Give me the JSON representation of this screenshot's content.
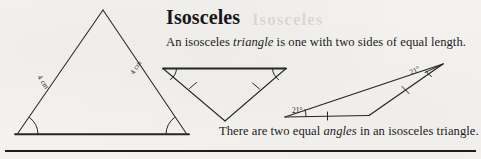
{
  "page": {
    "background_color": "#f4f2ee",
    "ink_color": "#1d1d20"
  },
  "heading": {
    "text": "Isosceles"
  },
  "bleed_through": {
    "text": "Isosceles"
  },
  "body": {
    "line_1": {
      "before": "An isosceles ",
      "emphasis": "triangle",
      "after": " is one with two sides of equal length."
    },
    "line_2": {
      "before": "There are two equal ",
      "emphasis": "angles",
      "after": " in an isosceles triangle."
    }
  },
  "figures": {
    "large_triangle": {
      "name": "isosceles-triangle-with-side-lengths",
      "left_side_label": "4 cm",
      "right_side_label": "4 cm",
      "base_angle_marks": 2
    },
    "inverted_triangle": {
      "name": "inverted-isosceles-triangle",
      "tick_marks": 2,
      "angle_marks": 2
    },
    "thin_triangle": {
      "name": "shallow-isosceles-triangle-with-angles",
      "angle_label_left": "21°",
      "angle_label_right": "21°",
      "tick_marks": 2
    }
  },
  "divider": {
    "name": "horizontal-rule"
  }
}
